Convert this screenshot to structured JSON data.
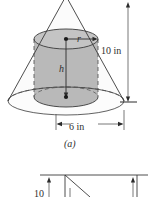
{
  "figure": {
    "caption_a": "(a)",
    "colors": {
      "cylinder_fill": "#b9b9b9",
      "cone_fill": "#fbfbfb",
      "cylinder_top_fill": "#c4c4c4",
      "stroke": "#3a3a3a",
      "dimension_stroke": "#555555",
      "background": "#ffffff"
    },
    "cone": {
      "height_label": "10 in",
      "diameter_label": "6 in"
    },
    "cylinder": {
      "radius_label": "r",
      "height_label": "h"
    },
    "dimensions": [
      {
        "name": "cone-height",
        "value": "10 in",
        "orientation": "vertical"
      },
      {
        "name": "cone-diameter",
        "value": "6 in",
        "orientation": "horizontal"
      }
    ],
    "lower_figure": {
      "partial_label": "10",
      "description": "Partially visible second figure (b) cut off at bottom edge"
    }
  }
}
